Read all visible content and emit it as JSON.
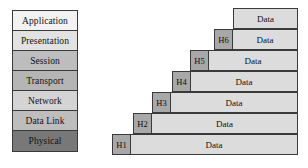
{
  "diagram": {
    "osi_stack": {
      "name": "OSI layer stack",
      "layers": [
        {
          "label": "Application",
          "fill": "#f2f2f2"
        },
        {
          "label": "Presentation",
          "fill": "#e2e2e2"
        },
        {
          "label": "Session",
          "fill": "#bdbdbd"
        },
        {
          "label": "Transport",
          "fill": "#b5b5b5"
        },
        {
          "label": "Network",
          "fill": "#d4d4d4"
        },
        {
          "label": "Data Link",
          "fill": "#bdbdbd"
        },
        {
          "label": "Physical",
          "fill": "#787878"
        }
      ]
    },
    "encapsulation": {
      "name": "Encapsulation staircase",
      "data_label": "Data",
      "rows": [
        {
          "header": "",
          "data": "Data",
          "left": 233,
          "top": 8,
          "right": 298
        },
        {
          "header": "H6",
          "data": "Data",
          "left": 214,
          "top": 29,
          "right": 298
        },
        {
          "header": "H5",
          "data": "Data",
          "left": 190,
          "top": 50,
          "right": 298
        },
        {
          "header": "H4",
          "data": "Data",
          "left": 172,
          "top": 71,
          "right": 298
        },
        {
          "header": "H3",
          "data": "Data",
          "left": 152,
          "top": 92,
          "right": 298
        },
        {
          "header": "H2",
          "data": "Data",
          "left": 133,
          "top": 113,
          "right": 298
        },
        {
          "header": "H1",
          "data": "Data",
          "left": 112,
          "top": 134,
          "right": 298
        }
      ]
    },
    "colors": {
      "border": "#3a3a3a",
      "header_fill": "#a8a8a8",
      "data_fill": "#dcdcdc",
      "background": "#ffffff"
    }
  }
}
